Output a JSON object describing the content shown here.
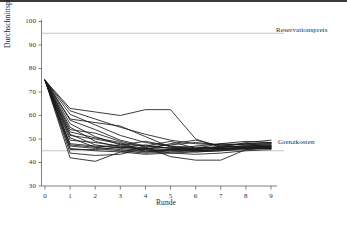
{
  "chart_data": {
    "type": "line",
    "title": "",
    "xlabel": "Runde",
    "ylabel": "Durchschnittspreis in Taler",
    "x": [
      0,
      1,
      2,
      3,
      4,
      5,
      6,
      7,
      8,
      9
    ],
    "xlim": [
      -0.35,
      9.35
    ],
    "ylim": [
      28,
      102
    ],
    "xticks": [
      "0",
      "1",
      "2",
      "3",
      "4",
      "5",
      "6",
      "7",
      "8",
      "9"
    ],
    "yticks": [
      "30",
      "40",
      "50",
      "60",
      "70",
      "80",
      "90",
      "100"
    ],
    "ytick_values": [
      30,
      40,
      50,
      60,
      70,
      80,
      90,
      100
    ],
    "grid": false,
    "legend": "none",
    "line_color": "#1a1a1a",
    "reference_line_color": "#9a9a9a",
    "annotations": [
      {
        "name": "Reservationspreis",
        "label": "Reservationspreis",
        "y": 95,
        "type": "horizontal-reference-line"
      },
      {
        "name": "Grenzkosten",
        "label": "Grenzkosten",
        "y": 45,
        "type": "horizontal-reference-line"
      }
    ],
    "series": [
      {
        "name": "Markt 1",
        "values": [
          75,
          62.0,
          58.5,
          55.0,
          52.0,
          49.5,
          48.0,
          47.5,
          47.5,
          48.0
        ]
      },
      {
        "name": "Markt 2",
        "values": [
          75,
          60.5,
          56.0,
          51.5,
          48.5,
          47.0,
          46.5,
          46.5,
          47.0,
          47.5
        ]
      },
      {
        "name": "Markt 3",
        "values": [
          75,
          58.0,
          54.0,
          49.5,
          47.0,
          46.0,
          46.0,
          46.5,
          47.0,
          47.0
        ]
      },
      {
        "name": "Markt 4",
        "values": [
          75,
          56.5,
          51.0,
          47.5,
          46.0,
          45.5,
          45.5,
          46.0,
          46.5,
          46.5
        ]
      },
      {
        "name": "Markt 5",
        "values": [
          75,
          55.0,
          49.0,
          46.5,
          45.5,
          45.0,
          45.0,
          45.5,
          46.0,
          46.0
        ]
      },
      {
        "name": "Markt 6",
        "values": [
          75,
          52.0,
          47.5,
          46.0,
          45.0,
          45.5,
          46.0,
          46.0,
          46.5,
          46.5
        ]
      },
      {
        "name": "Markt 7",
        "values": [
          75,
          50.5,
          46.5,
          45.5,
          44.5,
          45.0,
          45.5,
          46.0,
          46.0,
          46.0
        ]
      },
      {
        "name": "Markt 8",
        "values": [
          75,
          48.0,
          47.0,
          46.5,
          46.0,
          46.5,
          45.0,
          45.5,
          46.5,
          47.0
        ]
      },
      {
        "name": "Markt 9",
        "values": [
          75,
          47.0,
          46.0,
          45.0,
          44.0,
          44.5,
          45.0,
          45.5,
          46.0,
          46.5
        ]
      },
      {
        "name": "Markt 10",
        "values": [
          75,
          46.0,
          45.0,
          44.5,
          43.5,
          44.0,
          44.5,
          45.0,
          45.5,
          46.0
        ]
      },
      {
        "name": "Markt 11",
        "values": [
          75,
          45.5,
          45.5,
          46.5,
          47.5,
          46.0,
          44.5,
          45.0,
          46.0,
          47.0
        ]
      },
      {
        "name": "Markt 12",
        "values": [
          75,
          63.0,
          61.5,
          60.0,
          62.5,
          62.5,
          50.0,
          46.5,
          47.0,
          47.5
        ]
      },
      {
        "name": "Markt 13",
        "values": [
          75,
          58.5,
          57.0,
          55.5,
          51.0,
          46.5,
          46.0,
          48.0,
          49.0,
          48.5
        ]
      },
      {
        "name": "Markt 14",
        "values": [
          75,
          54.0,
          52.5,
          49.0,
          46.5,
          47.5,
          48.5,
          47.5,
          48.0,
          48.5
        ]
      },
      {
        "name": "Markt 15",
        "values": [
          75,
          42.0,
          40.5,
          44.5,
          46.5,
          42.5,
          41.0,
          41.0,
          45.5,
          46.5
        ]
      },
      {
        "name": "Markt 16",
        "values": [
          75,
          44.0,
          43.0,
          43.5,
          46.0,
          44.0,
          43.5,
          44.0,
          45.0,
          45.5
        ]
      },
      {
        "name": "Markt 17",
        "values": [
          75,
          49.5,
          48.5,
          47.0,
          45.5,
          48.0,
          49.5,
          47.0,
          46.5,
          47.0
        ]
      },
      {
        "name": "Markt 18",
        "values": [
          75,
          51.5,
          50.0,
          48.0,
          47.0,
          49.0,
          46.0,
          46.5,
          48.5,
          49.5
        ]
      },
      {
        "name": "Markt 19",
        "values": [
          75,
          53.0,
          50.5,
          48.5,
          44.5,
          45.5,
          47.0,
          48.0,
          47.5,
          48.0
        ]
      },
      {
        "name": "Markt 20",
        "values": [
          75,
          47.5,
          46.5,
          47.5,
          49.0,
          47.0,
          45.5,
          47.0,
          48.0,
          48.5
        ]
      }
    ]
  }
}
